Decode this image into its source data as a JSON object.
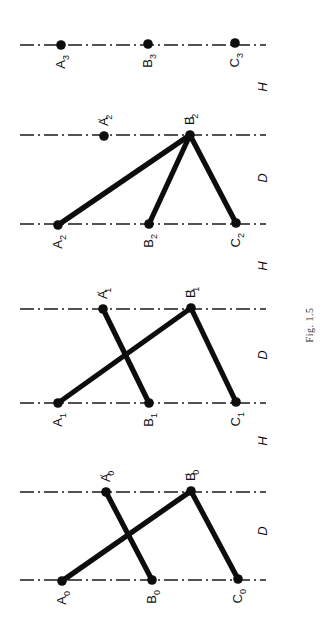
{
  "figure": {
    "caption": "Fig. 1.5",
    "colors": {
      "ink": "#0d0d0d",
      "background": "#ffffff"
    },
    "axes": [
      {
        "id": "block3-line",
        "y": 45,
        "x1": 20,
        "x2": 266
      },
      {
        "id": "block2-top",
        "y": 135,
        "x1": 20,
        "x2": 266
      },
      {
        "id": "block2-bottom",
        "y": 224,
        "x1": 20,
        "x2": 266
      },
      {
        "id": "block1-top",
        "y": 309,
        "x1": 20,
        "x2": 266
      },
      {
        "id": "block1-bottom",
        "y": 403,
        "x1": 20,
        "x2": 266
      },
      {
        "id": "block0-top",
        "y": 492,
        "x1": 20,
        "x2": 266
      },
      {
        "id": "block0-bottom",
        "y": 580,
        "x1": 20,
        "x2": 266
      }
    ],
    "blocks": [
      {
        "name": "block-3",
        "points": [
          {
            "base": "A",
            "sub": "3",
            "prime": false,
            "x": 61,
            "y": 45
          },
          {
            "base": "B",
            "sub": "3",
            "prime": false,
            "x": 148,
            "y": 44
          },
          {
            "base": "C",
            "sub": "3",
            "prime": false,
            "x": 235,
            "y": 43
          }
        ],
        "segments": []
      },
      {
        "name": "block-2",
        "points": [
          {
            "base": "A",
            "sub": "2",
            "prime": true,
            "x": 104,
            "y": 136
          },
          {
            "base": "B",
            "sub": "2",
            "prime": true,
            "x": 190,
            "y": 135
          },
          {
            "base": "A",
            "sub": "2",
            "prime": false,
            "x": 58,
            "y": 225
          },
          {
            "base": "B",
            "sub": "2",
            "prime": false,
            "x": 149,
            "y": 224
          },
          {
            "base": "C",
            "sub": "2",
            "prime": false,
            "x": 236,
            "y": 223
          }
        ],
        "segments": [
          {
            "from": "A2",
            "to": "B'2",
            "x1": 58,
            "y1": 225,
            "x2": 190,
            "y2": 135
          },
          {
            "from": "B2",
            "to": "B'2",
            "x1": 149,
            "y1": 224,
            "x2": 190,
            "y2": 135
          },
          {
            "from": "C2",
            "to": "B'2",
            "x1": 236,
            "y1": 223,
            "x2": 190,
            "y2": 135
          }
        ]
      },
      {
        "name": "block-1",
        "points": [
          {
            "base": "A",
            "sub": "1",
            "prime": true,
            "x": 103,
            "y": 309
          },
          {
            "base": "B",
            "sub": "1",
            "prime": true,
            "x": 191,
            "y": 308
          },
          {
            "base": "A",
            "sub": "1",
            "prime": false,
            "x": 58,
            "y": 403
          },
          {
            "base": "B",
            "sub": "1",
            "prime": false,
            "x": 149,
            "y": 403
          },
          {
            "base": "C",
            "sub": "1",
            "prime": false,
            "x": 236,
            "y": 402
          }
        ],
        "segments": [
          {
            "from": "A'1",
            "to": "B1",
            "x1": 103,
            "y1": 309,
            "x2": 149,
            "y2": 403
          },
          {
            "from": "A1",
            "to": "B'1",
            "x1": 58,
            "y1": 403,
            "x2": 191,
            "y2": 308
          },
          {
            "from": "B'1",
            "to": "C1",
            "x1": 191,
            "y1": 308,
            "x2": 236,
            "y2": 402
          }
        ]
      },
      {
        "name": "block-0",
        "points": [
          {
            "base": "A",
            "sub": "0",
            "prime": true,
            "x": 106,
            "y": 492
          },
          {
            "base": "B",
            "sub": "0",
            "prime": true,
            "x": 191,
            "y": 491
          },
          {
            "base": "A",
            "sub": "0",
            "prime": false,
            "x": 62,
            "y": 581
          },
          {
            "base": "B",
            "sub": "0",
            "prime": false,
            "x": 152,
            "y": 580
          },
          {
            "base": "C",
            "sub": "0",
            "prime": false,
            "x": 238,
            "y": 579
          }
        ],
        "segments": [
          {
            "from": "A'0",
            "to": "B0",
            "x1": 106,
            "y1": 492,
            "x2": 152,
            "y2": 580
          },
          {
            "from": "A0",
            "to": "B'0",
            "x1": 62,
            "y1": 581,
            "x2": 191,
            "y2": 491
          },
          {
            "from": "B'0",
            "to": "C0",
            "x1": 191,
            "y1": 491,
            "x2": 238,
            "y2": 579
          }
        ]
      }
    ],
    "dimension_labels": [
      {
        "text": "H",
        "x": 262,
        "y": 87
      },
      {
        "text": "D",
        "x": 262,
        "y": 178
      },
      {
        "text": "H",
        "x": 262,
        "y": 266
      },
      {
        "text": "D",
        "x": 262,
        "y": 355
      },
      {
        "text": "H",
        "x": 262,
        "y": 441
      },
      {
        "text": "D",
        "x": 262,
        "y": 531
      }
    ],
    "caption_pos": {
      "x": 309,
      "y": 325
    }
  }
}
